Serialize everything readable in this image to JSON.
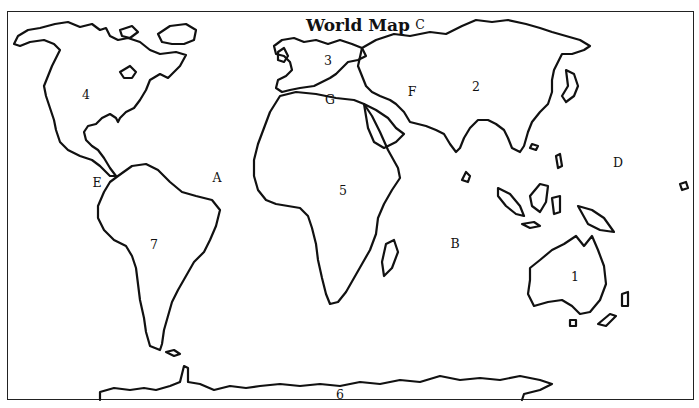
{
  "title": "World Map",
  "labels": {
    "oceans": [
      {
        "id": "A",
        "text": "A"
      },
      {
        "id": "B",
        "text": "B"
      },
      {
        "id": "C",
        "text": "C"
      },
      {
        "id": "D",
        "text": "D"
      }
    ],
    "features": [
      {
        "id": "E",
        "text": "E"
      },
      {
        "id": "F",
        "text": "F"
      },
      {
        "id": "G",
        "text": "G"
      }
    ],
    "continents": [
      {
        "id": "1",
        "text": "1"
      },
      {
        "id": "2",
        "text": "2"
      },
      {
        "id": "3",
        "text": "3"
      },
      {
        "id": "4",
        "text": "4"
      },
      {
        "id": "5",
        "text": "5"
      },
      {
        "id": "6",
        "text": "6"
      },
      {
        "id": "7",
        "text": "7"
      }
    ]
  },
  "colors": {
    "outline": "#111111",
    "background": "#ffffff"
  }
}
